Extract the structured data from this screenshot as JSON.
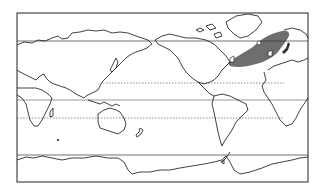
{
  "map": {
    "type": "world-outline-map",
    "projection": "equirectangular, Pacific-centered",
    "frame_color": "#222222",
    "land_outline_color": "#111111",
    "highlight_region": {
      "name": "north-atlantic-shaded-region",
      "color": "#6e6e6e"
    },
    "reference_lines": [
      {
        "name": "arctic-circle",
        "style": "solid"
      },
      {
        "name": "tropic-of-cancer",
        "style": "dashed"
      },
      {
        "name": "equator",
        "style": "solid"
      },
      {
        "name": "tropic-of-capricorn",
        "style": "dashed"
      },
      {
        "name": "antarctic-circle",
        "style": "solid"
      }
    ]
  }
}
